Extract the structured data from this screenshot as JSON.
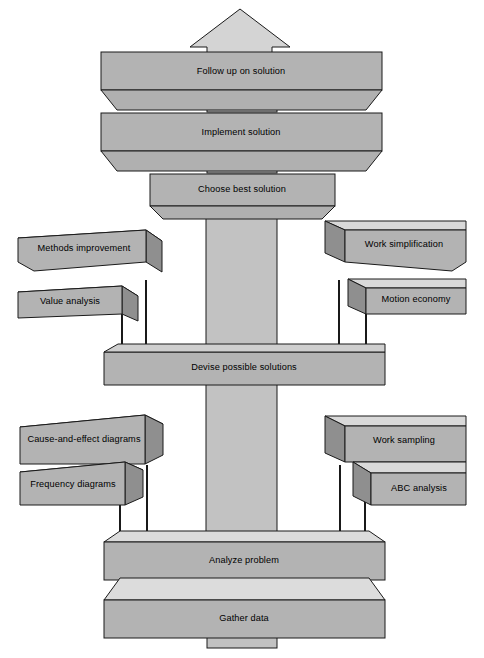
{
  "diagram": {
    "colors": {
      "front_face": "#b3b3b3",
      "top_face": "#d9d9d9",
      "side_face": "#8f8f8f",
      "pillar": "#c2c2c2",
      "outline": "#1a1a1a",
      "background": "#ffffff",
      "connector": "#000000"
    },
    "spine": {
      "arrow_label": "up-arrow",
      "steps": [
        {
          "id": "follow-up",
          "label": "Follow up on solution"
        },
        {
          "id": "implement",
          "label": "Implement solution"
        },
        {
          "id": "choose-best",
          "label": "Choose best solution"
        },
        {
          "id": "devise",
          "label": "Devise possible solutions"
        },
        {
          "id": "analyze",
          "label": "Analyze problem"
        },
        {
          "id": "gather",
          "label": "Gather data"
        }
      ]
    },
    "branches": {
      "devise_left": [
        {
          "id": "methods-improvement",
          "label": "Methods improvement"
        },
        {
          "id": "value-analysis",
          "label": "Value analysis"
        }
      ],
      "devise_right": [
        {
          "id": "work-simplification",
          "label": "Work simplification"
        },
        {
          "id": "motion-economy",
          "label": "Motion economy"
        }
      ],
      "analyze_left": [
        {
          "id": "cause-and-effect-diagrams",
          "label": "Cause-and-effect diagrams"
        },
        {
          "id": "frequency-diagrams",
          "label": "Frequency diagrams"
        }
      ],
      "analyze_right": [
        {
          "id": "work-sampling",
          "label": "Work sampling"
        },
        {
          "id": "abc-analysis",
          "label": "ABC analysis"
        }
      ]
    }
  }
}
